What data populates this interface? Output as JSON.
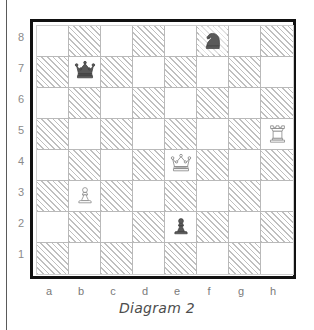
{
  "figure": {
    "caption": "Diagram 2"
  },
  "board": {
    "orientation": "white-bottom",
    "light_square_color": "#ffffff",
    "dark_square_color": "#bfbfbf",
    "dark_square_style": "diagonal-hatch",
    "border_color": "#111111",
    "grid_line_color": "#b9b9b9",
    "label_color": "#8a8a8a",
    "file_labels": [
      "a",
      "b",
      "c",
      "d",
      "e",
      "f",
      "g",
      "h"
    ],
    "rank_labels": [
      "8",
      "7",
      "6",
      "5",
      "4",
      "3",
      "2",
      "1"
    ],
    "squares": [
      [
        "a8",
        "b8",
        "c8",
        "d8",
        "e8",
        "f8",
        "g8",
        "h8"
      ],
      [
        "a7",
        "b7",
        "c7",
        "d7",
        "e7",
        "f7",
        "g7",
        "h7"
      ],
      [
        "a6",
        "b6",
        "c6",
        "d6",
        "e6",
        "f6",
        "g6",
        "h6"
      ],
      [
        "a5",
        "b5",
        "c5",
        "d5",
        "e5",
        "f5",
        "g5",
        "h5"
      ],
      [
        "a4",
        "b4",
        "c4",
        "d4",
        "e4",
        "f4",
        "g4",
        "h4"
      ],
      [
        "a3",
        "b3",
        "c3",
        "d3",
        "e3",
        "f3",
        "g3",
        "h3"
      ],
      [
        "a2",
        "b2",
        "c2",
        "d2",
        "e2",
        "f2",
        "g2",
        "h2"
      ],
      [
        "a1",
        "b1",
        "c1",
        "d1",
        "e1",
        "f1",
        "g1",
        "h1"
      ]
    ]
  },
  "position": {
    "fen": "5n2/1q6/8/7R/4Q3/1P6/4p3/8",
    "pieces": [
      {
        "square": "f8",
        "color": "black",
        "type": "knight",
        "icon": "black-knight-icon",
        "symbol": "♞"
      },
      {
        "square": "b7",
        "color": "black",
        "type": "queen",
        "icon": "black-queen-icon",
        "symbol": "♛"
      },
      {
        "square": "h5",
        "color": "white",
        "type": "rook",
        "icon": "white-rook-icon",
        "symbol": "♖"
      },
      {
        "square": "e4",
        "color": "white",
        "type": "queen",
        "icon": "white-queen-icon",
        "symbol": "♕"
      },
      {
        "square": "b3",
        "color": "white",
        "type": "pawn",
        "icon": "white-pawn-icon",
        "symbol": "♙"
      },
      {
        "square": "e2",
        "color": "black",
        "type": "pawn",
        "icon": "black-pawn-icon",
        "symbol": "♟"
      }
    ],
    "white_piece_fill": "#ffffff",
    "white_piece_stroke": "#7a7a7a",
    "black_piece_fill": "#595959",
    "black_piece_stroke": "#3f3f3f"
  }
}
